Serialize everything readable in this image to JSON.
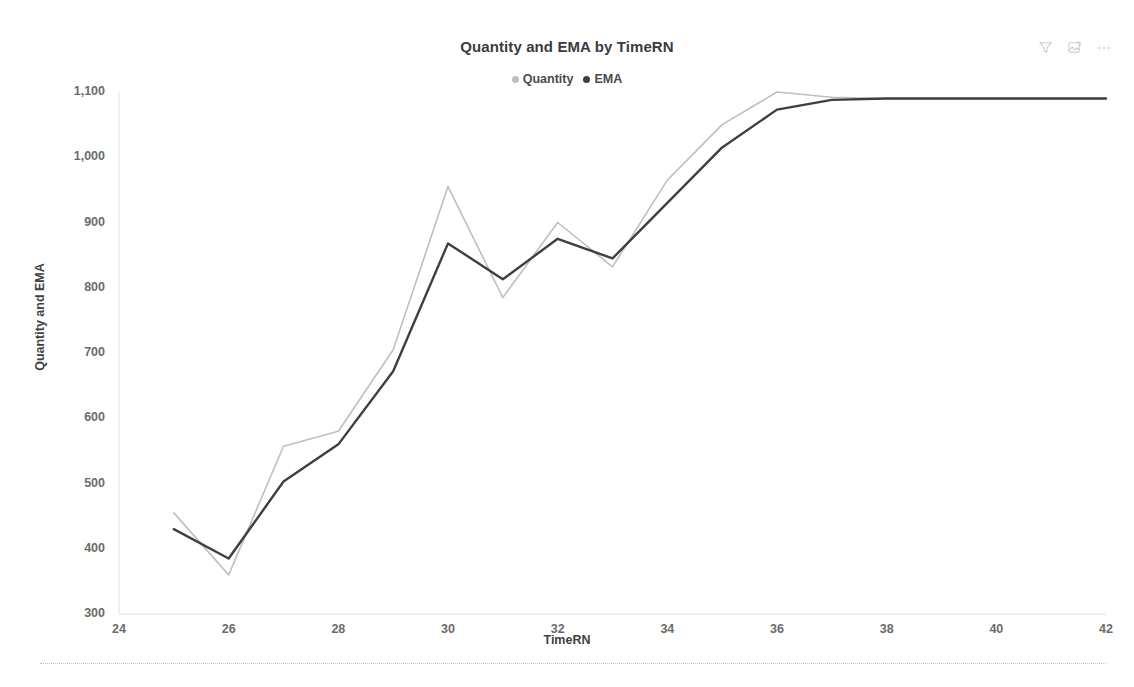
{
  "header": {
    "title": "Quantity and EMA by TimeRN"
  },
  "toolbar": {
    "items": [
      {
        "name": "filter-icon",
        "label": "Filter"
      },
      {
        "name": "focus-mode-icon",
        "label": "Focus mode"
      },
      {
        "name": "more-options-icon",
        "label": "More options"
      }
    ]
  },
  "legend": {
    "position": "top-center",
    "entries": [
      {
        "label": "Quantity",
        "color": "#bfbfbf"
      },
      {
        "label": "EMA",
        "color": "#3f3f3f"
      }
    ]
  },
  "axes": {
    "y": {
      "label": "Quantity and EMA",
      "ticks": [
        "300",
        "400",
        "500",
        "600",
        "700",
        "800",
        "900",
        "1,000",
        "1,100"
      ],
      "min": 300,
      "max": 1100
    },
    "x": {
      "label": "TimeRN",
      "ticks": [
        "24",
        "26",
        "28",
        "30",
        "32",
        "34",
        "36",
        "38",
        "40",
        "42"
      ],
      "min": 24,
      "max": 42
    }
  },
  "chart_data": {
    "type": "line",
    "title": "Quantity and EMA by TimeRN",
    "xlabel": "TimeRN",
    "ylabel": "Quantity and EMA",
    "xlim": [
      24,
      42
    ],
    "ylim": [
      300,
      1100
    ],
    "grid": false,
    "legend_position": "top-center",
    "x": [
      25,
      26,
      27,
      28,
      29,
      30,
      31,
      32,
      33,
      34,
      35,
      36,
      37,
      38,
      39,
      40,
      41,
      42
    ],
    "series": [
      {
        "name": "Quantity",
        "color": "#bfbfbf",
        "values": [
          455,
          360,
          557,
          580,
          705,
          955,
          785,
          900,
          832,
          965,
          1050,
          1100,
          1092,
          1090,
          1090,
          1090,
          1090,
          1090
        ]
      },
      {
        "name": "EMA",
        "color": "#3f3f3f",
        "values": [
          430,
          385,
          503,
          560,
          672,
          868,
          813,
          875,
          845,
          930,
          1015,
          1073,
          1088,
          1090,
          1090,
          1090,
          1090,
          1090
        ]
      }
    ]
  }
}
